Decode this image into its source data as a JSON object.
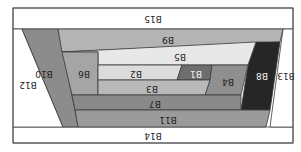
{
  "diagram": {
    "orientation": "rotated-180",
    "frame": {
      "x": 13,
      "y": 8,
      "w": 280,
      "h": 135,
      "stroke": "#555555"
    },
    "blocks": [
      {
        "id": "B15",
        "label": "B15",
        "fill": "#ffffff",
        "points": "13,8 293,8 293,29 13,29",
        "label_pos": [
          153,
          18
        ]
      },
      {
        "id": "B14",
        "label": "B14",
        "fill": "#ffffff",
        "points": "13,127 293,127 293,143 13,143",
        "label_pos": [
          153,
          135
        ]
      },
      {
        "id": "B12",
        "label": "B12",
        "fill": "#ffffff",
        "points": "13,29 22,29 63,127 13,127",
        "label_pos": [
          28,
          84
        ]
      },
      {
        "id": "B13",
        "label": "B13",
        "fill": "#ffffff",
        "points": "283,29 293,29 293,127 270,127",
        "label_pos": [
          286,
          75
        ]
      },
      {
        "id": "B10",
        "label": "B10",
        "fill": "#8c8c8c",
        "points": "22,29 58,29 75,110 78,127 63,127",
        "label_pos": [
          44,
          73
        ]
      },
      {
        "id": "B9",
        "label": "B9",
        "fill": "#b4b4b4",
        "points": "58,29 283,29 280,42 62,52",
        "label_pos": [
          168,
          39
        ]
      },
      {
        "id": "B8",
        "label": "B8",
        "fill": "#262626",
        "points": "256,42 280,42 270,110 241,110 248,65",
        "label_pos": [
          262,
          75
        ]
      },
      {
        "id": "B5",
        "label": "B5",
        "fill": "#e8e8e8",
        "points": "98,52 62,52 256,42 248,65 98,65",
        "label_pos": [
          180,
          56
        ]
      },
      {
        "id": "B6",
        "label": "B6",
        "fill": "#a5a5a5",
        "points": "62,52 98,52 98,95 72,95",
        "label_pos": [
          84,
          73
        ]
      },
      {
        "id": "B2",
        "label": "B2",
        "fill": "#dcdcdc",
        "points": "98,65 182,65 177,80 98,80",
        "label_pos": [
          136,
          73
        ]
      },
      {
        "id": "B1",
        "label": "B1",
        "fill": "#6e6e6e",
        "points": "182,65 212,65 210,80 177,80",
        "label_pos": [
          196,
          73
        ]
      },
      {
        "id": "B4",
        "label": "B4",
        "fill": "#8f8f8f",
        "points": "212,65 248,65 241,95 205,95 210,80",
        "label_pos": [
          228,
          81
        ]
      },
      {
        "id": "B3",
        "label": "B3",
        "fill": "#b9b9b9",
        "points": "98,80 210,80 205,95 98,95",
        "label_pos": [
          152,
          88
        ]
      },
      {
        "id": "B7",
        "label": "B7",
        "fill": "#8a8a8a",
        "points": "72,95 241,95 241,110 75,110",
        "label_pos": [
          155,
          103
        ]
      },
      {
        "id": "B11",
        "label": "B11",
        "fill": "#9a9a9a",
        "points": "75,110 270,110 266,127 78,127",
        "label_pos": [
          168,
          119
        ]
      }
    ]
  }
}
